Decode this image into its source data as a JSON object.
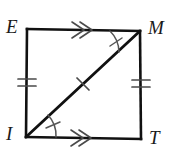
{
  "figure": {
    "shape_type": "quadrilateral",
    "stroke_color": "#111111",
    "mark_color": "#555555",
    "background_color": "#ffffff",
    "vertices": [
      {
        "name": "E",
        "label": "E",
        "x": 27,
        "y": 29,
        "label_x": 6,
        "label_y": 17
      },
      {
        "name": "M",
        "label": "M",
        "x": 140,
        "y": 31,
        "label_x": 148,
        "label_y": 18
      },
      {
        "name": "T",
        "label": "T",
        "x": 141,
        "y": 139,
        "label_x": 149,
        "label_y": 128
      },
      {
        "name": "I",
        "label": "I",
        "x": 26,
        "y": 137,
        "label_x": 6,
        "label_y": 124
      }
    ],
    "sides": [
      {
        "name": "EM",
        "from": "E",
        "to": "M",
        "mark": "double-arrow",
        "mark_count": 2
      },
      {
        "name": "MT",
        "from": "M",
        "to": "T",
        "mark": "double-tick",
        "mark_count": 2
      },
      {
        "name": "IT",
        "from": "I",
        "to": "T",
        "mark": "double-arrow",
        "mark_count": 2
      },
      {
        "name": "EI",
        "from": "E",
        "to": "I",
        "mark": "double-tick",
        "mark_count": 2
      }
    ],
    "diagonal": {
      "name": "IM",
      "from": "I",
      "to": "M",
      "mark": "single-tick",
      "mark_count": 1
    },
    "angle_marks": [
      {
        "name": "angle-EMI",
        "vertex": "M",
        "arc_count": 1,
        "tick_count": 1
      },
      {
        "name": "angle-MIT",
        "vertex": "I",
        "arc_count": 1,
        "tick_count": 1
      }
    ]
  }
}
